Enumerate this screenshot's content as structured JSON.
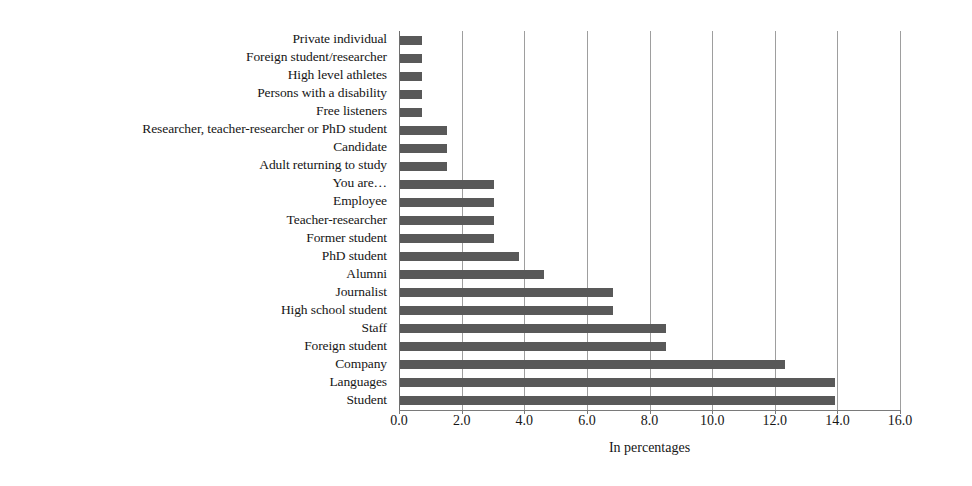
{
  "chart_data": {
    "type": "bar",
    "orientation": "horizontal",
    "title": "",
    "xlabel": "In percentages",
    "ylabel": "",
    "xlim": [
      0.0,
      16.0
    ],
    "xticks": [
      "0.0",
      "2.0",
      "4.0",
      "6.0",
      "8.0",
      "10.0",
      "12.0",
      "14.0",
      "16.0"
    ],
    "xtick_values": [
      0,
      2,
      4,
      6,
      8,
      10,
      12,
      14,
      16
    ],
    "grid": "vertical",
    "legend": "none",
    "bar_color": "#595959",
    "categories": [
      "Private individual",
      "Foreign student/researcher",
      "High level athletes",
      "Persons with a disability",
      "Free listeners",
      "Researcher, teacher-researcher or PhD student",
      "Candidate",
      "Adult returning to study",
      "You are…",
      "Employee",
      "Teacher-researcher",
      "Former student",
      "PhD student",
      "Alumni",
      "Journalist",
      "High school student",
      "Staff",
      "Foreign student",
      "Company",
      "Languages",
      "Student"
    ],
    "values": [
      0.7,
      0.7,
      0.7,
      0.7,
      0.7,
      1.5,
      1.5,
      1.5,
      3.0,
      3.0,
      3.0,
      3.0,
      3.8,
      4.6,
      6.8,
      6.8,
      8.5,
      8.5,
      12.3,
      13.9,
      13.9
    ]
  }
}
